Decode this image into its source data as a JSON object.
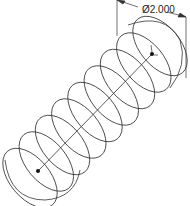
{
  "drawing": {
    "type": "helix-spring-isometric",
    "dimension": {
      "label": "Ø2.000"
    },
    "colors": {
      "line": "#333333",
      "background": "#ffffff"
    },
    "axis": {
      "start": [
        38,
        171
      ],
      "end": [
        152,
        54
      ]
    },
    "coils": 9
  }
}
